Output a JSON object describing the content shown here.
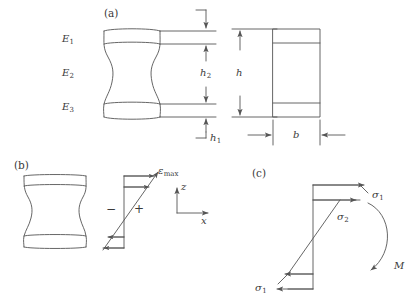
{
  "figure": {
    "panels": [
      {
        "id": "a",
        "tag": "(a)"
      },
      {
        "id": "b",
        "tag": "(b)"
      },
      {
        "id": "c",
        "tag": "(c)"
      }
    ],
    "stroke_color": "#555555",
    "text_color": "#3a3a3a",
    "background": "#ffffff"
  },
  "panel_a": {
    "tag": "(a)",
    "modulus_labels": [
      {
        "base": "E",
        "sub": "1",
        "text": "E1"
      },
      {
        "base": "E",
        "sub": "2",
        "text": "E2"
      },
      {
        "base": "E",
        "sub": "3",
        "text": "E3"
      }
    ],
    "dimensions": [
      {
        "base": "h",
        "sub": "2",
        "text": "h2"
      },
      {
        "base": "h",
        "sub": "1",
        "text": "h1"
      },
      {
        "base": "h",
        "sub": "",
        "text": "h"
      },
      {
        "base": "b",
        "sub": "",
        "text": "b"
      }
    ]
  },
  "panel_b": {
    "tag": "(b)",
    "strain_label": {
      "base": "ε",
      "sub": "max",
      "text": "εmax"
    },
    "sign_negative": "−",
    "sign_positive": "+",
    "axes": [
      {
        "base": "z",
        "text": "z"
      },
      {
        "base": "x",
        "text": "x"
      }
    ]
  },
  "panel_c": {
    "tag": "(c)",
    "stress_labels": [
      {
        "base": "σ",
        "sub": "1",
        "text": "σ1",
        "position": "top-right"
      },
      {
        "base": "σ",
        "sub": "2",
        "text": "σ2",
        "position": "middle"
      },
      {
        "base": "σ",
        "sub": "1",
        "text": "σ1",
        "position": "bottom-left"
      }
    ],
    "moment_label": {
      "base": "M",
      "sub": "",
      "text": "M"
    }
  }
}
